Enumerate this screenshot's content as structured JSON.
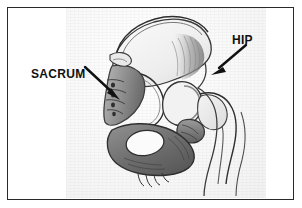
{
  "figure": {
    "kind": "scanned-pencil-anatomical-sketch",
    "border_color": "#2a2a2a",
    "background_color": "#ffffff",
    "paper_color": "#f6f6f6",
    "ink_color": "#111111"
  },
  "annotations": [
    {
      "id": "sacrum",
      "label": "SACRUM",
      "arrow_from": [
        76,
        58
      ],
      "arrow_to": [
        109,
        89
      ],
      "arrow_direction": "down-right"
    },
    {
      "id": "hip",
      "label": "HIP",
      "arrow_from": [
        231,
        36
      ],
      "arrow_to": [
        202,
        64
      ],
      "arrow_direction": "down-left"
    }
  ],
  "drawing": {
    "structures": [
      "iliac crest",
      "ilium wing",
      "sacrum with sacral vertebral segments",
      "greater sciatic notch",
      "acetabulum / hip joint",
      "femoral head and neck",
      "greater trochanter",
      "pubis",
      "ischium",
      "obturator foramen",
      "coccyx"
    ]
  }
}
